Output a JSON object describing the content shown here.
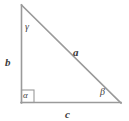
{
  "figure": {
    "kind": "right-triangle-diagram",
    "width": 129,
    "height": 121,
    "background_color": "#ffffff",
    "line_color": "#9a9a9a",
    "label_color": "#3a3a3a"
  },
  "vertices": {
    "top": {
      "x": 21,
      "y": 5
    },
    "bottom_left": {
      "x": 21,
      "y": 103
    },
    "bottom_right": {
      "x": 121,
      "y": 103
    }
  },
  "sides": [
    {
      "id": "a",
      "label": "a",
      "role": "hypotenuse",
      "from": "top",
      "to": "bottom_right",
      "label_position": {
        "x": 73,
        "y": 47
      }
    },
    {
      "id": "b",
      "label": "b",
      "role": "vertical-leg",
      "from": "top",
      "to": "bottom_left",
      "label_position": {
        "x": 5,
        "y": 57
      }
    },
    {
      "id": "c",
      "label": "c",
      "role": "horizontal-leg",
      "from": "bottom_left",
      "to": "bottom_right",
      "label_position": {
        "x": 65,
        "y": 109
      }
    }
  ],
  "angles": [
    {
      "id": "gamma",
      "label": "γ",
      "at_vertex": "top",
      "label_position": {
        "x": 25,
        "y": 22
      }
    },
    {
      "id": "alpha",
      "label": "α",
      "at_vertex": "bottom_left",
      "is_right_angle": true,
      "label_position": {
        "x": 23,
        "y": 91
      }
    },
    {
      "id": "beta",
      "label": "β",
      "at_vertex": "bottom_right",
      "label_position": {
        "x": 100,
        "y": 87
      }
    }
  ],
  "right_angle_marker": {
    "x": 21,
    "y": 90,
    "size": 13,
    "shown": true
  }
}
